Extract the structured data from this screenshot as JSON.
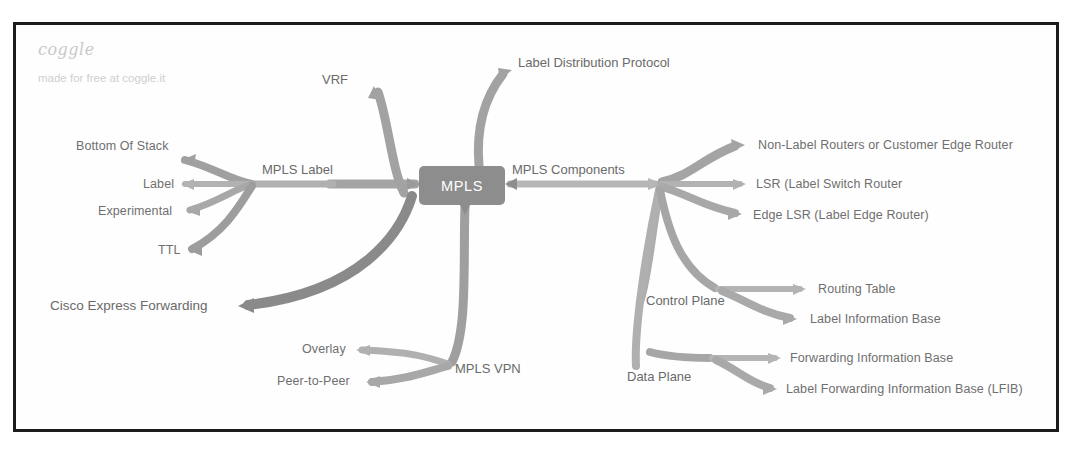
{
  "watermark": {
    "brand": "coggle",
    "tagline": "made for free at coggle.it"
  },
  "mindmap": {
    "root": "MPLS",
    "branches": {
      "mpls_label": {
        "title": "MPLS Label",
        "children": [
          "Bottom Of Stack",
          "Label",
          "Experimental",
          "TTL"
        ]
      },
      "vrf": {
        "title": "VRF"
      },
      "label_distribution_protocol": {
        "title": "Label Distribution Protocol"
      },
      "cisco_express_forwarding": {
        "title": "Cisco Express Forwarding"
      },
      "mpls_vpn": {
        "title": "MPLS VPN",
        "children": [
          "Overlay",
          "Peer-to-Peer"
        ]
      },
      "mpls_components": {
        "title": "MPLS Components",
        "children": [
          "Non-Label Routers or Customer Edge Router",
          "LSR (Label Switch Router",
          "Edge LSR (Label Edge Router)"
        ],
        "control_plane": {
          "title": "Control Plane",
          "children": [
            "Routing Table",
            "Label Information Base"
          ]
        },
        "data_plane": {
          "title": "Data Plane",
          "children": [
            "Forwarding Information Base",
            "Label Forwarding Information Base (LFIB)"
          ]
        }
      }
    }
  },
  "colors": {
    "branch_gray": "#9a9a9a",
    "branch_gray_light": "#b4b4b4",
    "branch_dark": "#7d7d7d",
    "root_fill": "#8d8d8d",
    "text": "#6f6f6f",
    "frame": "#1c1c1c"
  }
}
